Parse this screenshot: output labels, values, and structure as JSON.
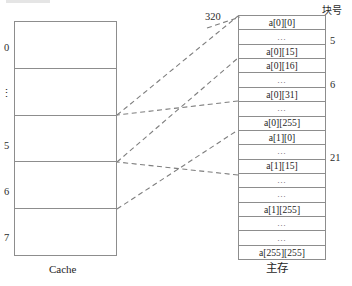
{
  "diagram": {
    "address_label": "320",
    "block_number_header": "块号",
    "cache": {
      "caption": "Cache",
      "row_labels": [
        "0",
        "⋮",
        "5",
        "6",
        "7"
      ]
    },
    "memory": {
      "caption": "主存",
      "rows": [
        {
          "text": "a[0][0]",
          "kind": "value"
        },
        {
          "text": "…",
          "kind": "ellipsis"
        },
        {
          "text": "a[0][15]",
          "kind": "value"
        },
        {
          "text": "a[0][16]",
          "kind": "value"
        },
        {
          "text": "…",
          "kind": "ellipsis"
        },
        {
          "text": "a[0][31]",
          "kind": "value"
        },
        {
          "text": "…",
          "kind": "ellipsis"
        },
        {
          "text": "a[0][255]",
          "kind": "value"
        },
        {
          "text": "a[1][0]",
          "kind": "value"
        },
        {
          "text": "…",
          "kind": "ellipsis"
        },
        {
          "text": "a[1][15]",
          "kind": "value"
        },
        {
          "text": "…",
          "kind": "ellipsis"
        },
        {
          "text": "…",
          "kind": "ellipsis"
        },
        {
          "text": "a[1][255]",
          "kind": "value"
        },
        {
          "text": "…",
          "kind": "ellipsis"
        },
        {
          "text": "…",
          "kind": "ellipsis"
        },
        {
          "text": "a[255][255]",
          "kind": "value"
        }
      ],
      "block_numbers": [
        {
          "label": "5",
          "top": 35
        },
        {
          "label": "6",
          "top": 79
        },
        {
          "label": "21",
          "top": 152
        }
      ]
    },
    "connectors": [
      {
        "from": "cache-row-1-bottom",
        "to": "memory-block-5-top",
        "x1": 117,
        "y1": 115,
        "x2": 238,
        "y2": 16
      },
      {
        "from": "cache-row-2-bottom",
        "to": "memory-block-6-top",
        "x1": 117,
        "y1": 162,
        "x2": 238,
        "y2": 58
      },
      {
        "from": "cache-row-3-bottom",
        "to": "memory-block-21-top",
        "x1": 117,
        "y1": 209,
        "x2": 238,
        "y2": 130
      },
      {
        "from": "memory-block-5-top",
        "to": "cache-row-1-bottom",
        "x1": 238,
        "y1": 101,
        "x2": 117,
        "y2": 115
      },
      {
        "from": "memory-row-mid",
        "to": "cache-row-2-bottom",
        "x1": 238,
        "y1": 175,
        "x2": 117,
        "y2": 162
      }
    ],
    "colors": {
      "line": "#8d8d8d",
      "dashed": "#7e7e7e",
      "text": "#1e1e1e",
      "background": "#ffffff"
    }
  }
}
